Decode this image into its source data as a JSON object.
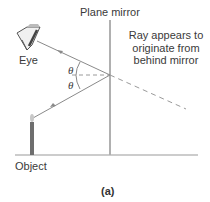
{
  "figure": {
    "caption": "(a)",
    "labels": {
      "mirror": "Plane mirror",
      "eye": "Eye",
      "object": "Object",
      "angle_upper": "θ",
      "angle_lower": "θ",
      "note_line1": "Ray appears to",
      "note_line2": "originate from",
      "note_line3": "behind mirror"
    },
    "colors": {
      "mirror": "#b0b0b0",
      "ray": "#8a8a8a",
      "dashed": "#9a9a9a",
      "ground": "#9a9a9a",
      "candle": "#6e6e6e",
      "flame": "#c8c8c8",
      "text": "#3a3a3a"
    }
  }
}
